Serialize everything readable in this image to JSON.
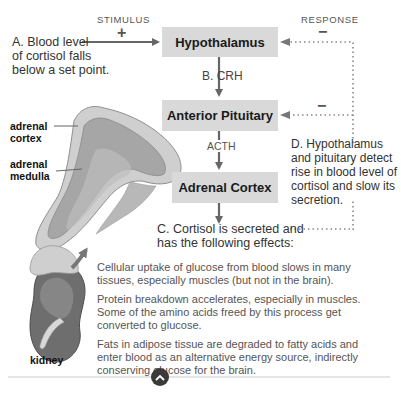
{
  "stimulus": {
    "label": "STIMULUS",
    "sign": "+"
  },
  "response": {
    "label": "RESPONSE",
    "sign": "−",
    "sign2": "−"
  },
  "steps": {
    "a": "A. Blood level of cortisol falls below a set point.",
    "a_lines": [
      "A. Blood level",
      "of cortisol falls",
      "below a set point."
    ],
    "b_hormone": "B. CRH",
    "acth": "ACTH",
    "c_lines": [
      "C. Cortisol is secreted and",
      "has the following effects:"
    ],
    "d_lines": [
      "D. Hypothalamus",
      "and pituitary detect",
      "rise in blood level of",
      "cortisol and slow its",
      "secretion."
    ]
  },
  "boxes": {
    "hypothalamus": "Hypothalamus",
    "anterior_pituitary": "Anterior Pituitary",
    "adrenal_cortex": "Adrenal Cortex"
  },
  "anatomy_labels": {
    "adrenal_cortex": [
      "adrenal",
      "cortex"
    ],
    "adrenal_medulla": [
      "adrenal",
      "medulla"
    ],
    "kidney": "kidney"
  },
  "effects": [
    [
      "Cellular uptake of glucose from blood slows in many",
      "tissues, especially muscles (but not in the brain)."
    ],
    [
      "Protein breakdown accelerates, especially in muscles.",
      "Some of the amino acids freed by this process get",
      "converted to glucose."
    ],
    [
      "Fats in adipose tissue are degraded to fatty acids and",
      "enter blood as an alternative energy source, indirectly",
      "conserving glucose for the brain."
    ]
  ],
  "nav": {
    "icon": "chevron-up-icon"
  },
  "colors": {
    "box_fill": "#d9d9d9",
    "arrow": "#666666",
    "dotted": "#888888",
    "adrenal_outer": "#c9c9c9",
    "adrenal_inner": "#9a9a9a",
    "kidney": "#6e6e6e"
  }
}
